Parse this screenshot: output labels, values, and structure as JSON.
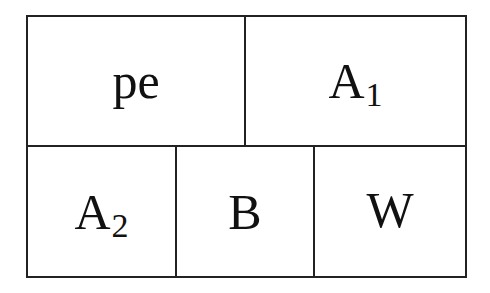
{
  "diagram": {
    "top_row": [
      {
        "main": "pe",
        "sub": ""
      },
      {
        "main": "A",
        "sub": "1"
      }
    ],
    "bottom_row": [
      {
        "main": "A",
        "sub": "2"
      },
      {
        "main": "B",
        "sub": ""
      },
      {
        "main": "W",
        "sub": ""
      }
    ]
  }
}
